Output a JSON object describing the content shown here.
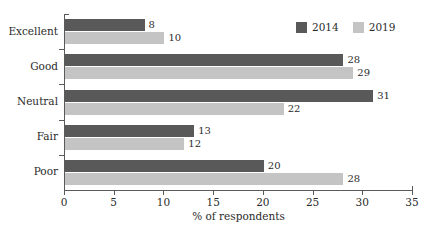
{
  "chart_data": {
    "type": "bar",
    "orientation": "horizontal",
    "title": "",
    "xlabel": "% of respondents",
    "ylabel": "",
    "xlim": [
      0,
      35
    ],
    "xticks": [
      0,
      5,
      10,
      15,
      20,
      25,
      30,
      35
    ],
    "grid": false,
    "legend_position": "top-right",
    "categories": [
      "Excellent",
      "Good",
      "Neutral",
      "Fair",
      "Poor"
    ],
    "series": [
      {
        "name": "2014",
        "color": "#595959",
        "values": [
          8,
          28,
          31,
          13,
          20
        ]
      },
      {
        "name": "2019",
        "color": "#c4c4c4",
        "values": [
          10,
          29,
          22,
          12,
          28
        ]
      }
    ]
  },
  "axis": {
    "x_title": "% of respondents"
  },
  "legend": {
    "items": [
      {
        "label": "2014"
      },
      {
        "label": "2019"
      }
    ]
  }
}
